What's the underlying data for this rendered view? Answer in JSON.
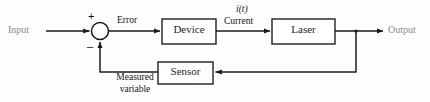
{
  "diagram": {
    "type": "control-system-block-diagram",
    "background_color": "#fdfdfd",
    "line_color": "#1a1a1a",
    "box_fill": "#ffffff",
    "box_stroke": "#1f1f1f",
    "terminal_text_color": "#8a8a8a",
    "body_text_color": "#1a1a1a"
  },
  "terminals": {
    "input_label": "Input",
    "output_label": "Output"
  },
  "summing_junction": {
    "name": "summing-junction",
    "plus_sign": "+",
    "minus_sign": "–",
    "cx": 100,
    "cy": 31,
    "r": 8.5
  },
  "blocks": [
    {
      "id": "device",
      "label": "Device",
      "x": 162,
      "y": 19,
      "w": 54,
      "h": 25
    },
    {
      "id": "laser",
      "label": "Laser",
      "x": 272,
      "y": 19,
      "w": 63,
      "h": 25
    },
    {
      "id": "sensor",
      "label": "Sensor",
      "x": 158,
      "y": 62,
      "w": 55,
      "h": 22
    }
  ],
  "signals": {
    "error_label": "Error",
    "current_symbol": "i(t)",
    "current_label": "Current",
    "measured_line1": "Measured",
    "measured_line2": "variable"
  },
  "paths": {
    "input_to_sum": "Input → summing junction",
    "sum_to_device": "summing junction → Device (Error)",
    "device_to_laser": "Device → Laser (Current, i(t))",
    "laser_to_output": "Laser → Output",
    "output_branch_to_sensor": "Output branch → Sensor",
    "sensor_to_sum": "Sensor → summing junction (Measured variable, negative)"
  }
}
